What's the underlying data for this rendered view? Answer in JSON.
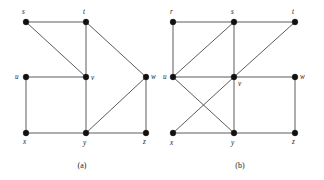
{
  "figure": {
    "background_color": "#ffffff",
    "node_color": "#111111",
    "edge_color": "#4a4a4a",
    "node_radius": 2.9,
    "width": 324,
    "height": 180
  },
  "graphs": [
    {
      "id": "graph-a",
      "caption": "(a)",
      "caption_pos": {
        "x": 82,
        "y": 168
      },
      "vertices": [
        {
          "id": "s",
          "label": "s",
          "x": 26,
          "y": 22,
          "label_x": 22,
          "label_y": 14
        },
        {
          "id": "t",
          "label": "t",
          "x": 86,
          "y": 22,
          "label_x": 83,
          "label_y": 14
        },
        {
          "id": "u",
          "label": "u",
          "x": 26,
          "y": 77,
          "label_x": 15,
          "label_y": 79
        },
        {
          "id": "v",
          "label": "v",
          "x": 86,
          "y": 77,
          "label_x": 91,
          "label_y": 80
        },
        {
          "id": "w",
          "label": "w",
          "x": 146,
          "y": 77,
          "label_x": 151,
          "label_y": 79
        },
        {
          "id": "x",
          "label": "x",
          "x": 26,
          "y": 133,
          "label_x": 23,
          "label_y": 144
        },
        {
          "id": "y",
          "label": "y",
          "x": 86,
          "y": 133,
          "label_x": 83,
          "label_y": 145
        },
        {
          "id": "z",
          "label": "z",
          "x": 146,
          "y": 133,
          "label_x": 143,
          "label_y": 144
        }
      ],
      "edges": [
        {
          "from": "s",
          "to": "t"
        },
        {
          "from": "s",
          "to": "v"
        },
        {
          "from": "t",
          "to": "v"
        },
        {
          "from": "t",
          "to": "w"
        },
        {
          "from": "u",
          "to": "v"
        },
        {
          "from": "u",
          "to": "x"
        },
        {
          "from": "v",
          "to": "y"
        },
        {
          "from": "w",
          "to": "y"
        },
        {
          "from": "w",
          "to": "z"
        },
        {
          "from": "x",
          "to": "y"
        },
        {
          "from": "y",
          "to": "z"
        }
      ]
    },
    {
      "id": "graph-b",
      "caption": "(b)",
      "caption_pos": {
        "x": 240,
        "y": 168
      },
      "vertices": [
        {
          "id": "r",
          "label": "r",
          "x": 173,
          "y": 22,
          "label_x": 170,
          "label_y": 14
        },
        {
          "id": "s",
          "label": "s",
          "x": 234,
          "y": 22,
          "label_x": 231,
          "label_y": 14
        },
        {
          "id": "t",
          "label": "t",
          "x": 295,
          "y": 22,
          "label_x": 292,
          "label_y": 14
        },
        {
          "id": "u",
          "label": "u",
          "x": 173,
          "y": 77,
          "label_x": 163,
          "label_y": 79
        },
        {
          "id": "v",
          "label": "v",
          "x": 234,
          "y": 77,
          "label_x": 238,
          "label_y": 86
        },
        {
          "id": "w",
          "label": "w",
          "x": 295,
          "y": 77,
          "label_x": 300,
          "label_y": 79
        },
        {
          "id": "x",
          "label": "x",
          "x": 173,
          "y": 133,
          "label_x": 170,
          "label_y": 145
        },
        {
          "id": "y",
          "label": "y",
          "x": 234,
          "y": 133,
          "label_x": 231,
          "label_y": 145
        },
        {
          "id": "z",
          "label": "z",
          "x": 295,
          "y": 133,
          "label_x": 292,
          "label_y": 144
        }
      ],
      "edges": [
        {
          "from": "r",
          "to": "s"
        },
        {
          "from": "r",
          "to": "u"
        },
        {
          "from": "s",
          "to": "t"
        },
        {
          "from": "s",
          "to": "u"
        },
        {
          "from": "s",
          "to": "v"
        },
        {
          "from": "t",
          "to": "v"
        },
        {
          "from": "u",
          "to": "v"
        },
        {
          "from": "u",
          "to": "y"
        },
        {
          "from": "v",
          "to": "w"
        },
        {
          "from": "v",
          "to": "x"
        },
        {
          "from": "v",
          "to": "y"
        },
        {
          "from": "w",
          "to": "z"
        },
        {
          "from": "x",
          "to": "y"
        },
        {
          "from": "y",
          "to": "z"
        }
      ]
    }
  ]
}
